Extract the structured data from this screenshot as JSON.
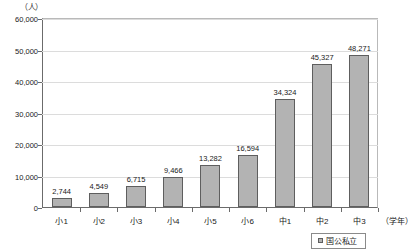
{
  "chart_data": {
    "type": "bar",
    "title": "",
    "xlabel": "（学年）",
    "ylabel": "（人）",
    "ylim": [
      0,
      60000
    ],
    "ytick_values": [
      0,
      10000,
      20000,
      30000,
      40000,
      50000,
      60000
    ],
    "ytick_labels": [
      "0",
      "10,000",
      "20,000",
      "30,000",
      "40,000",
      "50,000",
      "60,000"
    ],
    "grid": true,
    "legend_position": "bottom-right",
    "categories": [
      "小1",
      "小2",
      "小3",
      "小4",
      "小5",
      "小6",
      "中1",
      "中2",
      "中3"
    ],
    "values": [
      2744,
      4549,
      6715,
      9466,
      13282,
      16594,
      34324,
      45327,
      48271
    ],
    "value_labels": [
      "2,744",
      "4,549",
      "6,715",
      "9,466",
      "13,282",
      "16,594",
      "34,324",
      "45,327",
      "48,271"
    ],
    "series": [
      {
        "name": "国公私立",
        "color": "#b3b3b3",
        "values": [
          2744,
          4549,
          6715,
          9466,
          13282,
          16594,
          34324,
          45327,
          48271
        ]
      }
    ]
  },
  "legend": {
    "items": [
      {
        "label": "国公私立",
        "marker": "square-swatch"
      }
    ]
  }
}
